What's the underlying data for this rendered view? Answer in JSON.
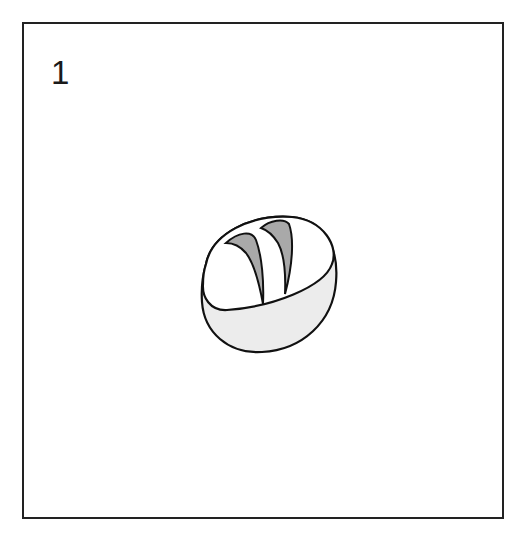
{
  "panel": {
    "number": "1",
    "illustration": "bread-loaf-icon",
    "colors": {
      "stroke": "#111111",
      "score_fill": "#a9a9a9",
      "base_fill": "#ececec",
      "top_fill": "#ffffff"
    }
  }
}
